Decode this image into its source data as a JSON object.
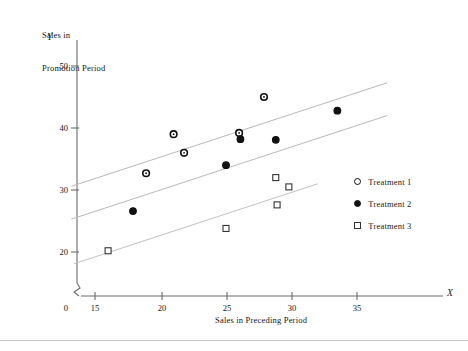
{
  "chart_data": {
    "type": "scatter",
    "title": "",
    "ylabel_line1": "Sales in",
    "ylabel_line2": "Promotion Period",
    "ylabel_symbol": "Y",
    "xlabel": "Sales in Preceding Period",
    "xlabel_symbol": "X",
    "xlim": [
      13.2,
      37.5
    ],
    "ylim": [
      16.5,
      52.5
    ],
    "x_ticks": [
      0,
      15,
      20,
      25,
      30,
      35
    ],
    "y_ticks": [
      0,
      20,
      30,
      40,
      50
    ],
    "x_tick_labels": [
      "0",
      "15",
      "20",
      "25",
      "30",
      "35"
    ],
    "y_tick_labels": [
      "0",
      "20",
      "30",
      "40",
      "50"
    ],
    "grid": false,
    "axis_break_x": true,
    "axis_break_y": true,
    "legend_position": "right",
    "series": [
      {
        "name": "Treatment 1",
        "marker": "open-circle",
        "color": "#111111",
        "points": [
          {
            "x": 18.9,
            "y": 32.7
          },
          {
            "x": 21.0,
            "y": 39.0
          },
          {
            "x": 21.8,
            "y": 36.0
          },
          {
            "x": 26.0,
            "y": 39.2
          },
          {
            "x": 27.9,
            "y": 45.0
          }
        ]
      },
      {
        "name": "Treatment 2",
        "marker": "filled-circle",
        "color": "#111111",
        "points": [
          {
            "x": 17.9,
            "y": 26.6
          },
          {
            "x": 25.0,
            "y": 34.0
          },
          {
            "x": 26.1,
            "y": 38.2
          },
          {
            "x": 28.8,
            "y": 38.1
          },
          {
            "x": 33.5,
            "y": 42.8
          }
        ]
      },
      {
        "name": "Treatment 3",
        "marker": "open-square",
        "color": "#333333",
        "points": [
          {
            "x": 16.0,
            "y": 20.2
          },
          {
            "x": 25.0,
            "y": 23.8
          },
          {
            "x": 28.8,
            "y": 32.0
          },
          {
            "x": 28.9,
            "y": 27.6
          },
          {
            "x": 29.8,
            "y": 30.5
          }
        ]
      }
    ],
    "fitted_lines": [
      {
        "name": "Treatment 1 fit",
        "x1": 13.2,
        "y1": 30.6,
        "x2": 37.3,
        "y2": 47.3,
        "color": "#b9b9b9"
      },
      {
        "name": "Treatment 2 fit",
        "x1": 13.2,
        "y1": 25.3,
        "x2": 37.3,
        "y2": 42.0,
        "color": "#b9b9b9"
      },
      {
        "name": "Treatment 3 fit",
        "x1": 13.4,
        "y1": 18.1,
        "x2": 32.0,
        "y2": 31.0,
        "color": "#c2c2c2"
      }
    ],
    "legend": [
      {
        "marker": "open-circle",
        "label": "Treatment 1"
      },
      {
        "marker": "filled-circle",
        "label": "Treatment 2"
      },
      {
        "marker": "open-square",
        "label": "Treatment 3"
      }
    ]
  }
}
